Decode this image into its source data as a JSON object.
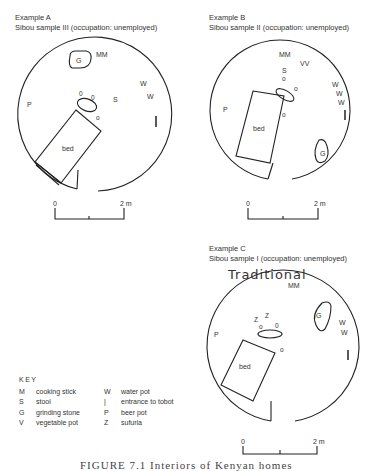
{
  "examples": [
    {
      "id": "A",
      "title": "Example A",
      "subtitle": "Sibou sample III (occupation: unemployed)",
      "labels": {
        "mm": "MM",
        "g": "G",
        "w1": "W",
        "w2": "W",
        "p": "P",
        "s": "S",
        "o1": "0",
        "o2": "0",
        "o3": "o",
        "bed": "bed"
      },
      "scale": {
        "start": "0",
        "end": "2 m"
      }
    },
    {
      "id": "B",
      "title": "Example B",
      "subtitle": "Sibou sample II (occupation: unemployed)",
      "labels": {
        "mm": "MM",
        "vv": "VV",
        "s": "S",
        "o1": "o",
        "o2": "o",
        "o3": "o",
        "w1": "W",
        "w2": "W",
        "w3": "W",
        "p": "P",
        "g": "G",
        "bed": "bed"
      },
      "scale": {
        "start": "0",
        "end": "2 m"
      }
    },
    {
      "id": "C",
      "title": "Example C",
      "subtitle": "Sibou sample I (occupation: unemployed)",
      "handwritten_note": "Traditional",
      "labels": {
        "mm": "MM",
        "g": "G",
        "z1": "Z",
        "z2": "Z",
        "o1": "o",
        "o2": "0",
        "o3": "o",
        "w1": "W",
        "w2": "W",
        "p": "P",
        "bed": "bed"
      },
      "scale": {
        "start": "0",
        "end": "2 m"
      }
    }
  ],
  "key": {
    "title": "KEY",
    "items": [
      {
        "code": "M",
        "desc": "cooking stick",
        "code2": "W",
        "desc2": "water pot"
      },
      {
        "code": "S",
        "desc": "stool",
        "code2": "|",
        "desc2": "entrance to tobot"
      },
      {
        "code": "G",
        "desc": "grinding stone",
        "code2": "P",
        "desc2": "beer pot"
      },
      {
        "code": "V",
        "desc": "vegetable pot",
        "code2": "Z",
        "desc2": "sufuria"
      }
    ]
  },
  "figure_caption": "FIGURE 7.1  Interiors of Kenyan homes"
}
